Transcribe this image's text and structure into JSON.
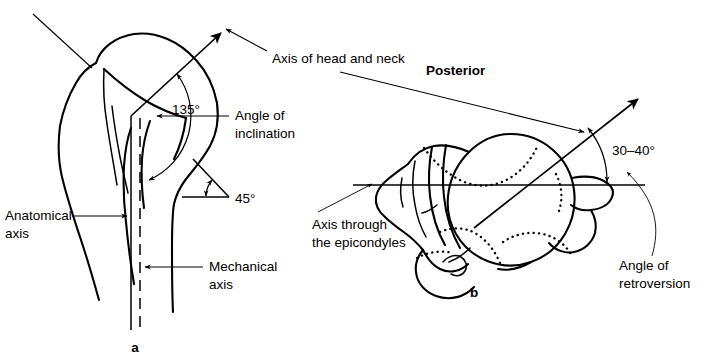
{
  "figure": {
    "background_color": "#ffffff",
    "ink_color": "#000000",
    "width": 705,
    "height": 364
  },
  "panel_a": {
    "letter": "a",
    "view": "anterior view of proximal humerus",
    "labels": {
      "axis_head_neck": "Axis of head and neck",
      "angle_inclination_line1": "Angle of",
      "angle_inclination_line2": "inclination",
      "anatomical_axis_line1": "Anatomical",
      "anatomical_axis_line2": "axis",
      "mechanical_axis_line1": "Mechanical",
      "mechanical_axis_line2": "axis"
    },
    "angles": {
      "inclination": "135°",
      "torsion": "45°"
    }
  },
  "panel_b": {
    "letter": "b",
    "view": "superior view of humerus",
    "labels": {
      "posterior": "Posterior",
      "axis_epicondyles_line1": "Axis through",
      "axis_epicondyles_line2": "the epicondyles",
      "angle_retroversion_line1": "Angle of",
      "angle_retroversion_line2": "retroversion"
    },
    "angles": {
      "retroversion": "30–40°"
    }
  }
}
